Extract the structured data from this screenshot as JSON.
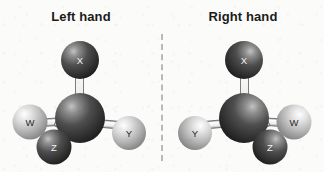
{
  "figure": {
    "kind": "molecular-model-pair",
    "divider": {
      "style": "dashed-vertical",
      "color": "#b9b9b9"
    }
  },
  "colors": {
    "background": "#fbfbfa",
    "title_text": "#1b1b1b",
    "dark_atom": "#3a3a3a",
    "dark_atom_highlight": "#b9b9b9",
    "light_atom": "#c9c9c9",
    "light_atom_highlight": "#ffffff",
    "bond_fill": "#f4f4f4",
    "bond_stroke": "#6e6e6e",
    "dark_label_text": "#f2f2f2",
    "light_label_text": "#2a2a2a",
    "divider": "#b9b9b9"
  },
  "panels": [
    {
      "id": "left-hand",
      "title": "Left hand",
      "center_atom": {
        "label": "",
        "shade": "dark"
      },
      "atoms": [
        {
          "label": "X",
          "shade": "dark",
          "position": "top"
        },
        {
          "label": "W",
          "shade": "light",
          "position": "left"
        },
        {
          "label": "Y",
          "shade": "light",
          "position": "right"
        },
        {
          "label": "Z",
          "shade": "dark",
          "position": "bottom-front"
        }
      ]
    },
    {
      "id": "right-hand",
      "title": "Right hand",
      "center_atom": {
        "label": "",
        "shade": "dark"
      },
      "atoms": [
        {
          "label": "X",
          "shade": "dark",
          "position": "top"
        },
        {
          "label": "Y",
          "shade": "light",
          "position": "left"
        },
        {
          "label": "W",
          "shade": "light",
          "position": "right"
        },
        {
          "label": "Z",
          "shade": "dark",
          "position": "bottom-front"
        }
      ]
    }
  ]
}
